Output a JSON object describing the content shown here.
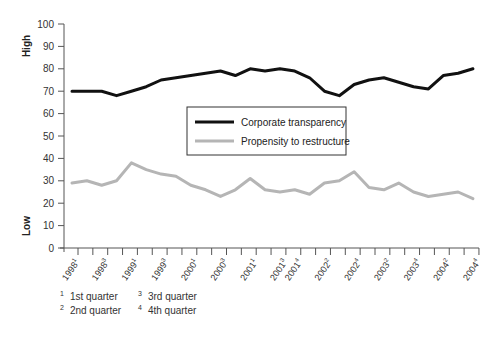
{
  "chart_data": {
    "type": "line",
    "title": "",
    "xlabel": "",
    "ylabel_high": "High",
    "ylabel_low": "Low",
    "ylim": [
      0,
      100
    ],
    "yticks": [
      0,
      10,
      20,
      30,
      40,
      50,
      60,
      70,
      80,
      90,
      100
    ],
    "grid": false,
    "legend_position": "center",
    "x": [
      "1998Q1",
      "1998Q2",
      "1998Q3",
      "1998Q4",
      "1999Q1",
      "1999Q2",
      "1999Q3",
      "1999Q4",
      "2000Q1",
      "2000Q2",
      "2000Q3",
      "2000Q4",
      "2001Q1",
      "2001Q2",
      "2001Q3",
      "2001Q4",
      "2002Q1",
      "2002Q2",
      "2002Q3",
      "2002Q4",
      "2003Q1",
      "2003Q2",
      "2003Q3",
      "2003Q4",
      "2004Q1",
      "2004Q2",
      "2004Q3",
      "2004Q4"
    ],
    "tick_labels": [
      {
        "year": "1998",
        "q": "1",
        "index": 0
      },
      {
        "year": "1998",
        "q": "3",
        "index": 2
      },
      {
        "year": "1999",
        "q": "1",
        "index": 4
      },
      {
        "year": "1999",
        "q": "3",
        "index": 6
      },
      {
        "year": "2000",
        "q": "1",
        "index": 8
      },
      {
        "year": "2000",
        "q": "3",
        "index": 10
      },
      {
        "year": "2001",
        "q": "1",
        "index": 12
      },
      {
        "year": "2001",
        "q": "3",
        "index": 14
      },
      {
        "year": "2001",
        "q": "4",
        "index": 15
      },
      {
        "year": "2002",
        "q": "2",
        "index": 17
      },
      {
        "year": "2002",
        "q": "4",
        "index": 19
      },
      {
        "year": "2003",
        "q": "2",
        "index": 21
      },
      {
        "year": "2003",
        "q": "4",
        "index": 23
      },
      {
        "year": "2004",
        "q": "2",
        "index": 25
      },
      {
        "year": "2004",
        "q": "4",
        "index": 27
      }
    ],
    "series": [
      {
        "name": "Corporate transparency",
        "color": "#111111",
        "values": [
          70,
          70,
          70,
          68,
          70,
          72,
          75,
          76,
          77,
          78,
          79,
          77,
          80,
          79,
          80,
          79,
          76,
          70,
          68,
          73,
          75,
          76,
          74,
          72,
          71,
          77,
          78,
          80
        ]
      },
      {
        "name": "Propensity to restructure",
        "color": "#b5b5b5",
        "values": [
          29,
          30,
          28,
          30,
          38,
          35,
          33,
          32,
          28,
          26,
          23,
          26,
          31,
          26,
          25,
          26,
          24,
          29,
          30,
          34,
          27,
          26,
          29,
          25,
          23,
          24,
          25,
          22
        ]
      }
    ]
  },
  "footnotes": [
    {
      "mark": "1",
      "label": "1st quarter"
    },
    {
      "mark": "2",
      "label": "2nd quarter"
    },
    {
      "mark": "3",
      "label": "3rd quarter"
    },
    {
      "mark": "4",
      "label": "4th quarter"
    }
  ]
}
